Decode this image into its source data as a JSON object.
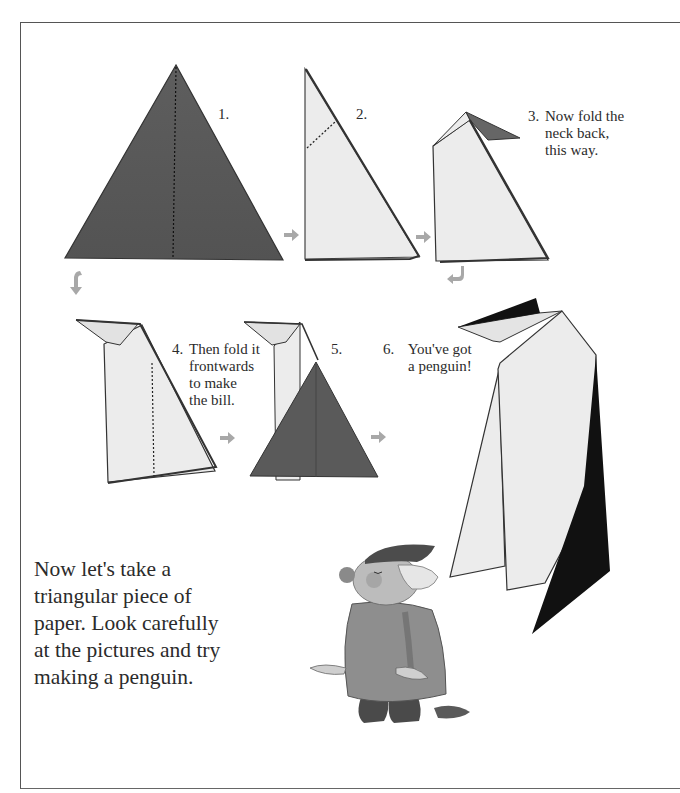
{
  "page": {
    "steps": [
      {
        "number": "1.",
        "text": ""
      },
      {
        "number": "2.",
        "text": ""
      },
      {
        "number": "3.",
        "lines": [
          "Now fold the",
          "neck back,",
          "this way."
        ]
      },
      {
        "number": "4.",
        "lines": [
          "Then fold it",
          "frontwards",
          "to make",
          "the bill."
        ]
      },
      {
        "number": "5.",
        "text": ""
      },
      {
        "number": "6.",
        "lines": [
          "You've got",
          "a penguin!"
        ]
      }
    ],
    "intro_lines": [
      "Now let's take a",
      "triangular piece of",
      "paper. Look carefully",
      "at the pictures and try",
      "making a penguin."
    ],
    "icons": [
      "arrow-right-icon",
      "arrow-down-curved-icon",
      "arrow-back-curved-icon"
    ],
    "colors": {
      "paper_dark": "#5a5a5a",
      "paper_light": "#ececec",
      "penguin_black": "#111111",
      "arrow_gray": "#a8a8a8",
      "text": "#2b2b2b"
    }
  }
}
